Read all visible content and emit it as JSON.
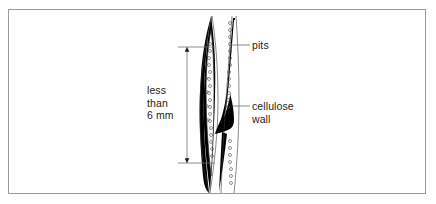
{
  "figure": {
    "kind": "biology-diagram",
    "background_color": "#ffffff",
    "frame_color": "#9a9a9a",
    "ink_color": "#000000",
    "text_color": "#232323"
  },
  "labels": {
    "pits": "pits",
    "cellulose_wall": "cellulose\nwall",
    "dimension": "less\nthan\n6 mm"
  },
  "dimension_line": {
    "value_text": "less than 6 mm",
    "orientation": "vertical",
    "arrowheads": "both-ends"
  },
  "leaders": [
    {
      "name": "pits-leader",
      "target": "pit-column"
    },
    {
      "name": "cellulose-wall-leader",
      "target": "thick-black-wall"
    }
  ],
  "cells": [
    {
      "name": "left-fibre-cell",
      "shape": "elongated-spindle",
      "wall": "thick-tapering"
    },
    {
      "name": "right-fibre-cell",
      "shape": "elongated-spindle",
      "wall": "thick-tapering"
    }
  ]
}
